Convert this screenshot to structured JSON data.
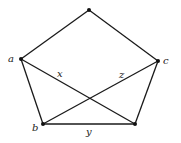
{
  "diagram": {
    "type": "graph",
    "vertices": [
      {
        "id": "top",
        "label": ""
      },
      {
        "id": "a",
        "label": "a"
      },
      {
        "id": "c",
        "label": "c"
      },
      {
        "id": "b",
        "label": "b"
      },
      {
        "id": "d",
        "label": ""
      }
    ],
    "edges": [
      {
        "from": "top",
        "to": "a",
        "label": ""
      },
      {
        "from": "top",
        "to": "c",
        "label": ""
      },
      {
        "from": "a",
        "to": "b",
        "label": ""
      },
      {
        "from": "c",
        "to": "d",
        "label": ""
      },
      {
        "from": "b",
        "to": "d",
        "label": "y"
      },
      {
        "from": "a",
        "to": "d",
        "label": "x"
      },
      {
        "from": "b",
        "to": "c",
        "label": "z"
      }
    ]
  }
}
